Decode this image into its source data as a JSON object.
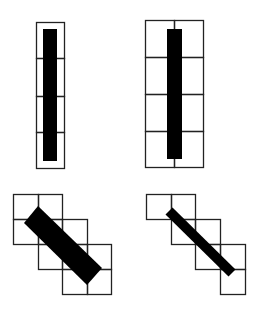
{
  "diagram": {
    "colors": {
      "grid": "#222222",
      "fill": "#000000",
      "background": "#ffffff"
    },
    "panels": [
      {
        "id": "vertical-single-column",
        "cells": [
          [
            36,
            22,
            28,
            36
          ],
          [
            36,
            58,
            28,
            38
          ],
          [
            36,
            96,
            28,
            36
          ],
          [
            36,
            132,
            28,
            36
          ]
        ],
        "bar": {
          "type": "rect",
          "x": 43,
          "y": 29,
          "w": 14,
          "h": 132
        }
      },
      {
        "id": "vertical-two-column",
        "cells": [
          [
            145,
            20,
            29,
            37
          ],
          [
            174,
            20,
            29,
            37
          ],
          [
            145,
            57,
            29,
            37
          ],
          [
            174,
            57,
            29,
            37
          ],
          [
            145,
            94,
            29,
            37
          ],
          [
            174,
            94,
            29,
            37
          ],
          [
            145,
            131,
            29,
            36
          ],
          [
            174,
            131,
            29,
            36
          ]
        ],
        "bar": {
          "type": "rect",
          "x": 167,
          "y": 29,
          "w": 15,
          "h": 130
        }
      },
      {
        "id": "diagonal-thick",
        "cells": [
          [
            13,
            194,
            25,
            25
          ],
          [
            38,
            194,
            24,
            25
          ],
          [
            13,
            219,
            25,
            25
          ],
          [
            38,
            219,
            24,
            25
          ],
          [
            62,
            219,
            25,
            25
          ],
          [
            38,
            244,
            24,
            25
          ],
          [
            62,
            244,
            25,
            25
          ],
          [
            87,
            244,
            24,
            25
          ],
          [
            62,
            269,
            25,
            25
          ],
          [
            87,
            269,
            24,
            25
          ]
        ],
        "bar": {
          "type": "polygon",
          "points": "24,223 38,206 102,268 87,285"
        }
      },
      {
        "id": "diagonal-thin",
        "cells": [
          [
            146,
            194,
            25,
            25
          ],
          [
            171,
            194,
            24,
            25
          ],
          [
            171,
            219,
            24,
            25
          ],
          [
            195,
            219,
            25,
            25
          ],
          [
            195,
            244,
            25,
            25
          ],
          [
            220,
            244,
            25,
            25
          ],
          [
            220,
            269,
            25,
            25
          ]
        ],
        "bar": {
          "type": "line",
          "x1": 169,
          "y1": 211,
          "x2": 232,
          "y2": 273,
          "width": 10
        }
      }
    ]
  }
}
